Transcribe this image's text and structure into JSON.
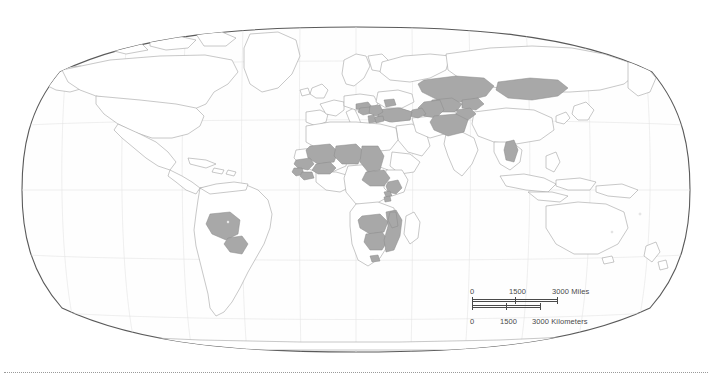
{
  "map": {
    "projection": "Robinson",
    "title": "",
    "background_color": "#ffffff",
    "land_fill": "#ffffff",
    "land_stroke": "#9b9b9b",
    "highlight_fill": "#a8a8a8",
    "highlight_stroke": "#8a8a8a",
    "graticule_color": "#e2e2e2",
    "frame_color": "#5a5a5a",
    "graticule": {
      "visible": true,
      "meridian_spacing_deg": 30,
      "parallel_spacing_deg": 30
    }
  },
  "scalebar": {
    "miles": {
      "unit_label": "3000 Miles",
      "ticks": [
        "0",
        "1500",
        "3000 Miles"
      ],
      "zero": "0",
      "mid": "1500",
      "end": "3000 Miles"
    },
    "kilometers": {
      "unit_label": "3000 Kilometers",
      "ticks": [
        "0",
        "1500",
        "3000 Kilometers"
      ],
      "zero": "0",
      "mid": "1500",
      "end": "3000 Kilometers"
    }
  },
  "highlighted_regions": {
    "count": 30,
    "list": [
      "Bolivia",
      "Paraguay",
      "Mali",
      "Niger",
      "Chad",
      "Central African Republic",
      "Guinea",
      "Sierra Leone",
      "Liberia",
      "Burkina Faso",
      "Uganda",
      "Rwanda",
      "Burundi",
      "Zambia",
      "Zimbabwe",
      "Mozambique",
      "Malawi",
      "Lesotho",
      "Kazakhstan",
      "Uzbekistan",
      "Turkmenistan",
      "Kyrgyzstan",
      "Tajikistan",
      "Afghanistan",
      "Mongolia",
      "Azerbaijan",
      "Laos",
      "Croatia",
      "Bosnia and Herzegovina",
      "Serbia",
      "Albania",
      "Macedonia",
      "Moldova",
      "Turkey"
    ]
  },
  "footer": {
    "rule_style": "dotted"
  }
}
